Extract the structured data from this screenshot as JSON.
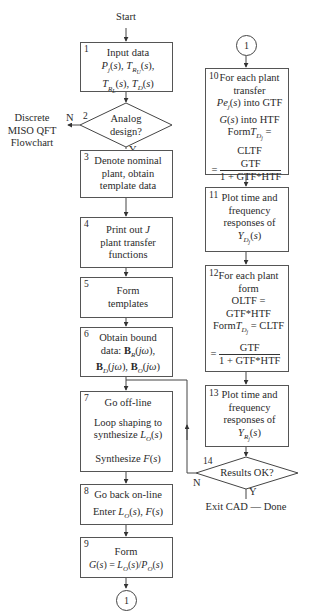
{
  "title": "Discrete MISO QFT Flowchart",
  "start_label": "Start",
  "side_label": [
    "Discrete",
    "MISO QFT",
    "Flowchart"
  ],
  "connector_label": "1",
  "branch_labels": {
    "no": "N",
    "yes": "Y"
  },
  "steps": [
    {
      "num": "1",
      "lines": [
        "Input data",
        "P_j(s), T_Ru(s),",
        "T_RL(s), T_D(s)"
      ]
    },
    {
      "num": "2",
      "type": "decision",
      "lines": [
        "Analog",
        "design?"
      ]
    },
    {
      "num": "3",
      "lines": [
        "Denote nominal",
        "plant, obtain",
        "template data"
      ]
    },
    {
      "num": "4",
      "lines": [
        "Print out J",
        "plant transfer",
        "functions"
      ]
    },
    {
      "num": "5",
      "lines": [
        "Form",
        "templates"
      ]
    },
    {
      "num": "6",
      "lines": [
        "Obtain bound",
        "data: B_R(jω),",
        "B_D(jω), B_O(jω)"
      ]
    },
    {
      "num": "7",
      "lines": [
        "Go off-line",
        "Loop shaping to",
        "synthesize L_O(s)",
        "Synthesize F(s)"
      ]
    },
    {
      "num": "8",
      "lines": [
        "Go back on-line",
        "Enter L_O(s), F(s)"
      ]
    },
    {
      "num": "9",
      "lines": [
        "Form",
        "G(s) = L_O(s)/P_O(s)"
      ]
    },
    {
      "num": "10",
      "lines": [
        "For each plant",
        "transfer",
        "Pe_j(s) into GTF",
        "G(s) into HTF",
        "Form T_Dj = CLTF",
        "= GTF / (1 + GTF*HTF)"
      ]
    },
    {
      "num": "11",
      "lines": [
        "Plot time and",
        "frequency",
        "responses of",
        "Y_Dj(s)"
      ]
    },
    {
      "num": "12",
      "lines": [
        "For each plant",
        "form",
        "OLTF = GTF*HTF",
        "Form T_Dj = CLTF",
        "= GTF / (1 + GTF*HTF)"
      ]
    },
    {
      "num": "13",
      "lines": [
        "Plot time and",
        "frequency",
        "responses of",
        "Y_Rj(s)"
      ]
    },
    {
      "num": "14",
      "type": "decision",
      "lines": [
        "Results OK?"
      ]
    }
  ],
  "end_label": "Exit CAD — Done",
  "text": {
    "s1_l1": "Input data",
    "s2_l1": "Analog",
    "s2_l2": "design?",
    "s3_l1": "Denote nominal",
    "s3_l2": "plant, obtain",
    "s3_l3": "template data",
    "s4_l1a": "Print out ",
    "s4_l1b": "J",
    "s4_l2": "plant transfer",
    "s4_l3": "functions",
    "s5_l1": "Form",
    "s5_l2": "templates",
    "s6_l1": "Obtain bound",
    "s7_l1": "Go off-line",
    "s7_l2": "Loop shaping to",
    "s7_l3": "synthesize ",
    "s7_l4": "Synthesize ",
    "s8_l1": "Go back on-line",
    "s8_l2": "Enter ",
    "s9_l1": "Form",
    "s10_l1": "For each plant",
    "s10_l2": "transfer",
    "s10_l3b": " into GTF",
    "s10_l4b": " into HTF",
    "s10_l5a": "Form",
    "s10_l5b": " = CLTF",
    "frac_num": "GTF",
    "frac_den": "1 + GTF*HTF",
    "s11_l1": "Plot time and",
    "s11_l2": "frequency",
    "s11_l3": "responses of",
    "s12_l1": "For each plant",
    "s12_l2": "form",
    "s12_l3": "OLTF = GTF*HTF",
    "s13_l1": "Plot time and",
    "s13_l2": "frequency",
    "s13_l3": "responses of",
    "s14_l1": "Results OK?"
  },
  "colors": {
    "line": "#444444",
    "text": "#2a2a2a",
    "background": "#ffffff"
  }
}
